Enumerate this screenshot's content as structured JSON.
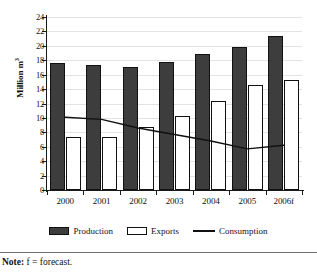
{
  "chart_data": {
    "type": "bar",
    "title": "",
    "xlabel": "",
    "ylabel": "Million m",
    "ylabel_sup": "3",
    "ylim": [
      0,
      24
    ],
    "ytick_step": 2,
    "yticks": [
      0,
      2,
      4,
      6,
      8,
      10,
      12,
      14,
      16,
      18,
      20,
      22,
      24
    ],
    "grid": true,
    "legend_position": "bottom",
    "categories": [
      "2000",
      "2001",
      "2002",
      "2003",
      "2004",
      "2005",
      "2006f"
    ],
    "series": [
      {
        "name": "Production",
        "type": "bar",
        "color": "#3d3d3d",
        "values": [
          17.6,
          17.3,
          17.1,
          17.8,
          18.9,
          19.9,
          21.3
        ]
      },
      {
        "name": "Exports",
        "type": "bar",
        "color": "#ffffff",
        "values": [
          7.4,
          7.3,
          8.7,
          10.3,
          12.3,
          14.5,
          15.2
        ]
      },
      {
        "name": "Consumption",
        "type": "line",
        "color": "#111111",
        "values": [
          10.1,
          9.8,
          8.6,
          7.7,
          6.8,
          5.7,
          6.2
        ]
      }
    ]
  },
  "legend": {
    "items": [
      {
        "label": "Production",
        "marker": "filled-square"
      },
      {
        "label": "Exports",
        "marker": "open-square"
      },
      {
        "label": "Consumption",
        "marker": "line"
      }
    ]
  },
  "note": {
    "prefix": "Note:",
    "text": " f = forecast."
  }
}
